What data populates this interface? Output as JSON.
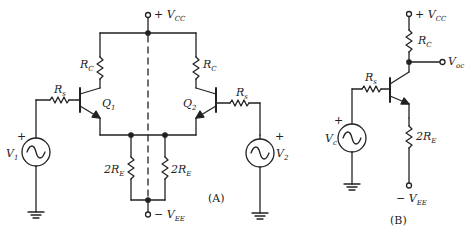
{
  "diagram_a": {
    "caption": "(A)",
    "vcc": {
      "sign": "+ ",
      "main": "V",
      "sub": "CC"
    },
    "vee": {
      "sign": "− ",
      "main": "V",
      "sub": "EE"
    },
    "rc_left": {
      "main": "R",
      "sub": "C"
    },
    "rc_right": {
      "main": "R",
      "sub": "C"
    },
    "rs_left": {
      "main": "R",
      "sub": "s"
    },
    "rs_right": {
      "main": "R",
      "sub": "s"
    },
    "q1": {
      "main": "Q",
      "sub": "1"
    },
    "q2": {
      "main": "Q",
      "sub": "2"
    },
    "re_left": {
      "main": "2R",
      "sub": "E"
    },
    "re_right": {
      "main": "2R",
      "sub": "E"
    },
    "v1": {
      "main": "V",
      "sub": "1",
      "polarity": "+"
    },
    "v2": {
      "main": "V",
      "sub": "2",
      "polarity": "+"
    }
  },
  "diagram_b": {
    "caption": "(B)",
    "vcc": {
      "sign": "+ ",
      "main": "V",
      "sub": "CC"
    },
    "vee": {
      "sign": "− ",
      "main": "V",
      "sub": "EE"
    },
    "rc": {
      "main": "R",
      "sub": "C"
    },
    "rs": {
      "main": "R",
      "sub": "s"
    },
    "re": {
      "main": "2R",
      "sub": "E"
    },
    "vc": {
      "main": "V",
      "sub": "c",
      "polarity": "+"
    },
    "voc": {
      "main": "V",
      "sub": "oc"
    }
  },
  "colors": {
    "line": "#222222",
    "background": "#ffffff"
  }
}
